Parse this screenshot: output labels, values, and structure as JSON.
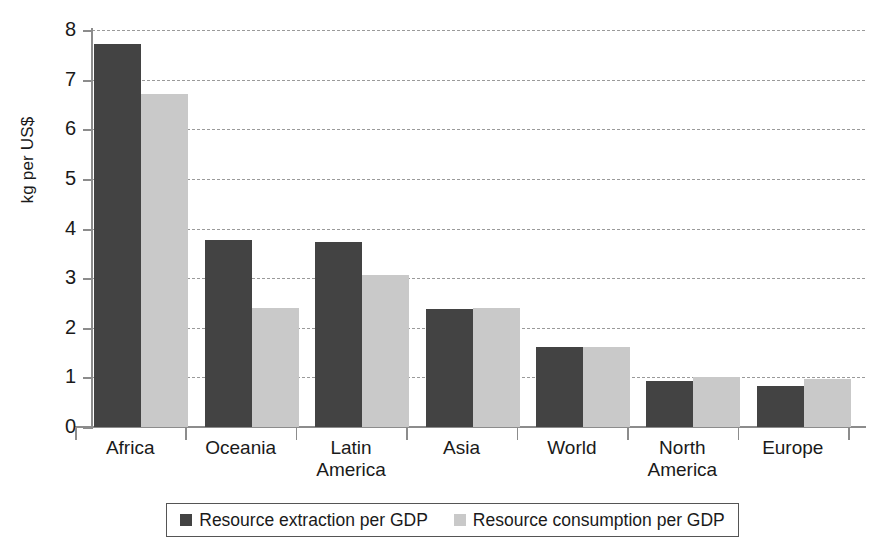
{
  "chart_data": {
    "type": "bar",
    "title": "",
    "xlabel": "",
    "ylabel": "kg per US$",
    "ylim": [
      0,
      8
    ],
    "ytick_labels": [
      "8",
      "7",
      "6",
      "5",
      "4",
      "3",
      "2",
      "1",
      "0"
    ],
    "ytick_values": [
      8,
      7,
      6,
      5,
      4,
      3,
      2,
      1,
      0
    ],
    "grid": true,
    "grid_axis": "y",
    "legend_position": "bottom",
    "categories": [
      "Africa",
      "Oceania",
      "Latin America",
      "Asia",
      "World",
      "North America",
      "Europe"
    ],
    "category_lines": [
      [
        "Africa"
      ],
      [
        "Oceania"
      ],
      [
        "Latin",
        "America"
      ],
      [
        "Asia"
      ],
      [
        "World"
      ],
      [
        "North",
        "America"
      ],
      [
        "Europe"
      ]
    ],
    "series": [
      {
        "name": "Resource extraction per GDP",
        "color": "#434343",
        "values": [
          7.72,
          3.77,
          3.73,
          2.38,
          1.62,
          0.93,
          0.83
        ]
      },
      {
        "name": "Resource consumption per GDP",
        "color": "#c9c9c9",
        "values": [
          6.72,
          2.39,
          3.07,
          2.39,
          1.62,
          1.0,
          0.97
        ]
      }
    ]
  },
  "legend": {
    "entries": [
      {
        "label": "Resource extraction per GDP",
        "swatch": "dark"
      },
      {
        "label": "Resource consumption per GDP",
        "swatch": "light"
      }
    ]
  },
  "colors": {
    "series_dark": "#434343",
    "series_light": "#c9c9c9",
    "axis": "#8c8c8c",
    "gridline": "#9a9a9a",
    "text": "#1a1a1a",
    "background": "#ffffff"
  }
}
